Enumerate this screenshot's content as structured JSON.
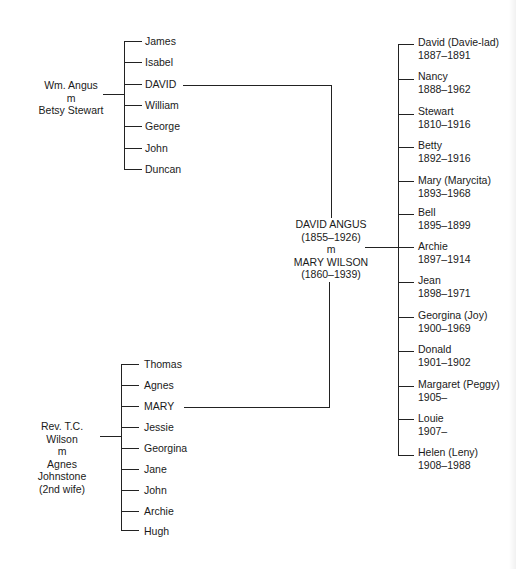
{
  "tree": {
    "paternal_parents": {
      "line1": "Wm. Angus",
      "line2": "m",
      "line3": "Betsy Stewart"
    },
    "paternal_children": [
      "James",
      "Isabel",
      "DAVID",
      "William",
      "George",
      "John",
      "Duncan"
    ],
    "maternal_parents": {
      "line1": "Rev. T.C. Wilson",
      "line2": "m",
      "line3": "Agnes Johnstone",
      "line4": "(2nd wife)"
    },
    "maternal_children": [
      "Thomas",
      "Agnes",
      "MARY",
      "Jessie",
      "Georgina",
      "Jane",
      "John",
      "Archie",
      "Hugh"
    ],
    "couple": {
      "husband": "DAVID ANGUS",
      "husband_dates": "(1855–1926)",
      "marriage": "m",
      "wife": "MARY WILSON",
      "wife_dates": "(1860–1939)"
    },
    "children": [
      {
        "name": "David (Davie-lad)",
        "dates": "1887–1891"
      },
      {
        "name": "Nancy",
        "dates": "1888–1962"
      },
      {
        "name": "Stewart",
        "dates": "1810–1916"
      },
      {
        "name": "Betty",
        "dates": "1892–1916"
      },
      {
        "name": "Mary (Marycita)",
        "dates": "1893–1968"
      },
      {
        "name": "Bell",
        "dates": "1895–1899"
      },
      {
        "name": "Archie",
        "dates": "1897–1914"
      },
      {
        "name": "Jean",
        "dates": "1898–1971"
      },
      {
        "name": "Georgina (Joy)",
        "dates": "1900–1969"
      },
      {
        "name": "Donald",
        "dates": "1901–1902"
      },
      {
        "name": "Margaret (Peggy)",
        "dates": "1905–"
      },
      {
        "name": "Louie",
        "dates": "1907–"
      },
      {
        "name": "Helen (Leny)",
        "dates": "1908–1988"
      }
    ]
  }
}
